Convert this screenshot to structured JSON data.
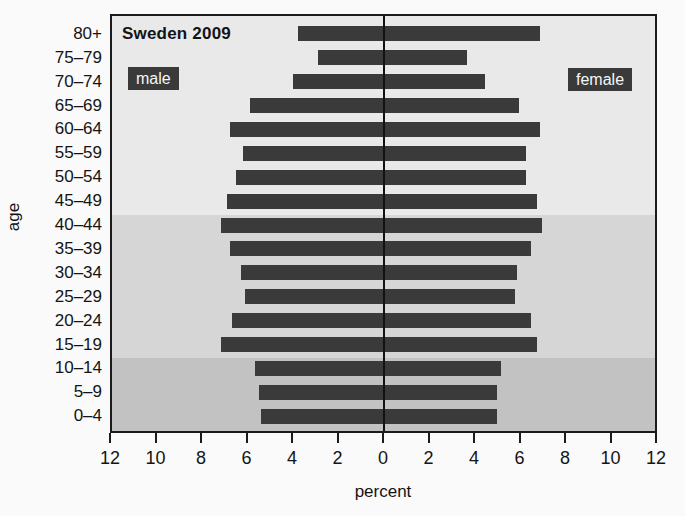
{
  "figure": {
    "title": "Sweden 2009",
    "left_series_label": "male",
    "right_series_label": "female",
    "xlabel": "percent",
    "ylabel": "age"
  },
  "chart_data": {
    "type": "bar",
    "subtype": "population-pyramid",
    "title": "Sweden 2009",
    "xlabel": "percent",
    "ylabel": "age",
    "xlim": [
      -12,
      12
    ],
    "x_tick_labels": [
      "12",
      "10",
      "8",
      "6",
      "4",
      "2",
      "0",
      "2",
      "4",
      "6",
      "8",
      "10",
      "12"
    ],
    "grid": false,
    "legend_position": "inside-top",
    "categories": [
      "80+",
      "75–79",
      "70–74",
      "65–69",
      "60–64",
      "55–59",
      "50–54",
      "45–49",
      "40–44",
      "35–39",
      "30–34",
      "25–29",
      "20–24",
      "15–19",
      "10–14",
      "5–9",
      "0–4"
    ],
    "series": [
      {
        "name": "male",
        "side": "left",
        "values": [
          3.8,
          2.9,
          4.0,
          5.9,
          6.8,
          6.2,
          6.5,
          6.9,
          7.2,
          6.8,
          6.3,
          6.1,
          6.7,
          7.2,
          5.7,
          5.5,
          5.4
        ]
      },
      {
        "name": "female",
        "side": "right",
        "values": [
          6.9,
          3.7,
          4.5,
          6.0,
          6.9,
          6.3,
          6.3,
          6.8,
          7.0,
          6.5,
          5.9,
          5.8,
          6.5,
          6.8,
          5.2,
          5.0,
          5.0
        ]
      }
    ],
    "background_age_bands": [
      {
        "age_range": "45+",
        "first_row": 0,
        "last_row": 7,
        "color": "#e9e9e9"
      },
      {
        "age_range": "15–44",
        "first_row": 8,
        "last_row": 13,
        "color": "#d6d6d6"
      },
      {
        "age_range": "0–14",
        "first_row": 14,
        "last_row": 16,
        "color": "#c2c2c2"
      }
    ],
    "bar_color": "#3a3a3a",
    "label_box_color": "#3a3a3a",
    "axis_color": "#1b1b1b"
  }
}
